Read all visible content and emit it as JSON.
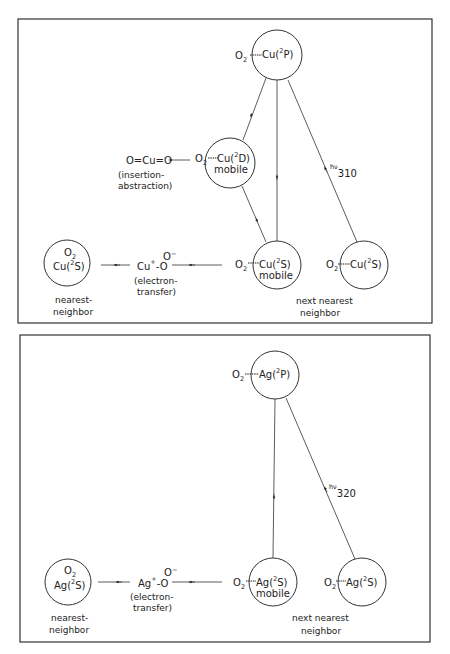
{
  "panels": [
    {
      "id": "copper",
      "states": {
        "excited_2P": {
          "ligand": "O",
          "ligand_sub": "2",
          "metal": "Cu(",
          "term_sup": "2",
          "term": "P)"
        },
        "excited_2D": {
          "ligand": "O",
          "ligand_sub": "2",
          "metal": "Cu(",
          "term_sup": "2",
          "term": "D)",
          "note": "mobile"
        },
        "ground_mobile": {
          "ligand": "O",
          "ligand_sub": "2",
          "metal": "Cu(",
          "term_sup": "2",
          "term": "S)",
          "note": "mobile"
        },
        "ground_next_nearest": {
          "ligand": "O",
          "ligand_sub": "2",
          "metal": "Cu(",
          "term_sup": "2",
          "term": "S)"
        },
        "ground_nearest": {
          "ligand": "O",
          "ligand_sub": "2",
          "metal": "Cu(",
          "term_sup": "2",
          "term": "S)"
        }
      },
      "insertion_product": "O=Cu=O",
      "insertion_label_1": "(insertion-",
      "insertion_label_2": "abstraction)",
      "intermediate": {
        "metal": "Cu",
        "charge": "+",
        "bond": "-O",
        "o2": "O",
        "o2_charge": "−"
      },
      "electron_label_1": "(electron-",
      "electron_label_2": "transfer)",
      "photon_label": "hν",
      "photon_sub": "310",
      "nearest_label_1": "nearest-",
      "nearest_label_2": "neighbor",
      "next_nearest_label_1": "next nearest",
      "next_nearest_label_2": "neighbor"
    },
    {
      "id": "silver",
      "states": {
        "excited_2P": {
          "ligand": "O",
          "ligand_sub": "2",
          "metal": "Ag(",
          "term_sup": "2",
          "term": "P)"
        },
        "ground_mobile": {
          "ligand": "O",
          "ligand_sub": "2",
          "metal": "Ag(",
          "term_sup": "2",
          "term": "S)",
          "note": "mobile"
        },
        "ground_next_nearest": {
          "ligand": "O",
          "ligand_sub": "2",
          "metal": "Ag(",
          "term_sup": "2",
          "term": "S)"
        },
        "ground_nearest": {
          "ligand": "O",
          "ligand_sub": "2",
          "metal": "Ag(",
          "term_sup": "2",
          "term": "S)"
        }
      },
      "intermediate": {
        "metal": "Ag",
        "charge": "+",
        "bond": "-O",
        "o2": "O",
        "o2_charge": "−"
      },
      "electron_label_1": "(electron-",
      "electron_label_2": "transfer)",
      "photon_label": "hν",
      "photon_sub": "320",
      "nearest_label_1": "nearest-",
      "nearest_label_2": "neighbor",
      "next_nearest_label_1": "next  nearest",
      "next_nearest_label_2": "neighbor"
    }
  ],
  "colors": {
    "ink": "#222222",
    "paper": "#ffffff"
  }
}
